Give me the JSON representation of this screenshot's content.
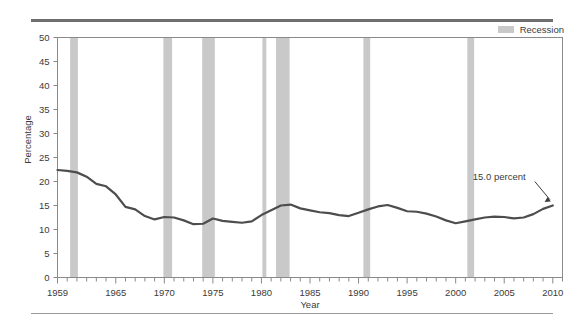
{
  "legend": {
    "items": [
      {
        "label": "Recession",
        "color": "#c9c9c9",
        "swatch_name": "recession-swatch"
      }
    ],
    "position": "top-right"
  },
  "colors": {
    "line": "#4d4d4d",
    "recession_band": "#c9c9c9",
    "axis": "#8a8a8a",
    "text": "#3b3b3b",
    "rule_top": "#6f6f6f",
    "rule_bottom": "#9a9a9a",
    "background": "#ffffff"
  },
  "chart_data": {
    "type": "line",
    "title": "",
    "subtitle": "",
    "xlabel": "Year",
    "ylabel": "Percentage",
    "xlim": [
      1959,
      2011
    ],
    "ylim": [
      0,
      50
    ],
    "grid": false,
    "legend_position": "top-right",
    "y_ticks": [
      0,
      5,
      10,
      15,
      20,
      25,
      30,
      35,
      40,
      45,
      50
    ],
    "y_tick_labels": [
      "0",
      "5",
      "10",
      "15",
      "20",
      "25",
      "30",
      "35",
      "40",
      "45",
      "50"
    ],
    "x_tick_labels": [
      "1959",
      "1965",
      "1970",
      "1975",
      "1980",
      "1985",
      "1990",
      "1995",
      "2000",
      "2005",
      "2010"
    ],
    "x_tick_values": [
      1959,
      1965,
      1970,
      1975,
      1980,
      1985,
      1990,
      1995,
      2000,
      2005,
      2010
    ],
    "x_minor_tick_step": 1,
    "series": [
      {
        "name": "Percentage",
        "color": "#4d4d4d",
        "x": [
          1959,
          1960,
          1961,
          1962,
          1963,
          1964,
          1965,
          1966,
          1967,
          1968,
          1969,
          1970,
          1971,
          1972,
          1973,
          1974,
          1975,
          1976,
          1977,
          1978,
          1979,
          1980,
          1981,
          1982,
          1983,
          1984,
          1985,
          1986,
          1987,
          1988,
          1989,
          1990,
          1991,
          1992,
          1993,
          1994,
          1995,
          1996,
          1997,
          1998,
          1999,
          2000,
          2001,
          2002,
          2003,
          2004,
          2005,
          2006,
          2007,
          2008,
          2009,
          2010
        ],
        "values": [
          22.4,
          22.2,
          21.9,
          21.0,
          19.5,
          19.0,
          17.3,
          14.7,
          14.2,
          12.8,
          12.1,
          12.6,
          12.5,
          11.9,
          11.1,
          11.2,
          12.3,
          11.8,
          11.6,
          11.4,
          11.7,
          13.0,
          14.0,
          15.0,
          15.2,
          14.4,
          14.0,
          13.6,
          13.4,
          13.0,
          12.8,
          13.5,
          14.2,
          14.8,
          15.1,
          14.5,
          13.8,
          13.7,
          13.3,
          12.7,
          11.9,
          11.3,
          11.7,
          12.1,
          12.5,
          12.7,
          12.6,
          12.3,
          12.5,
          13.2,
          14.3,
          15.0
        ]
      }
    ],
    "bands": [
      {
        "name": "recession-1960",
        "start": 1960.3,
        "end": 1961.1
      },
      {
        "name": "recession-1969",
        "start": 1969.9,
        "end": 1970.8
      },
      {
        "name": "recession-1973",
        "start": 1973.9,
        "end": 1975.2
      },
      {
        "name": "recession-1980",
        "start": 1980.1,
        "end": 1980.5
      },
      {
        "name": "recession-1981",
        "start": 1981.5,
        "end": 1982.9
      },
      {
        "name": "recession-1990",
        "start": 1990.5,
        "end": 1991.2
      },
      {
        "name": "recession-2001",
        "start": 2001.2,
        "end": 2001.9
      }
    ],
    "annotations": [
      {
        "name": "end-value-annotation",
        "text": "15.0 percent",
        "value": 15.0,
        "at_x": 2010,
        "at_y": 15.0
      }
    ]
  }
}
